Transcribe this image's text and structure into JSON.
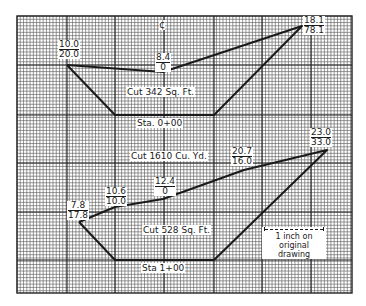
{
  "figure": {
    "type": "earthwork cross-sections on grid paper",
    "grid": {
      "left": 17,
      "top": 16,
      "right": 352,
      "bottom": 293,
      "minor_spacing": 3.27,
      "major_every": 15,
      "major_x": [
        67,
        115,
        164,
        214,
        262,
        311
      ],
      "major_y": [
        65,
        115,
        163,
        212,
        260
      ]
    },
    "centerline": {
      "symbol": "℄",
      "label": "¢",
      "x": 163,
      "y": 26
    }
  },
  "sections": [
    {
      "station": "Sta. 0+00",
      "area_label": "Cut 342 Sq. Ft.",
      "outline": [
        [
          67,
          65
        ],
        [
          163,
          72
        ],
        [
          302,
          26
        ],
        [
          214,
          115
        ],
        [
          115,
          115
        ],
        [
          67,
          65
        ]
      ],
      "elevations": [
        {
          "top": "10.0",
          "bottom": "20.0",
          "x": 58,
          "y": 40
        },
        {
          "top": "8.4",
          "bottom": "0",
          "x": 156,
          "y": 55
        },
        {
          "top": "18.1",
          "bottom": "78.1",
          "x": 304,
          "y": 17
        }
      ],
      "area_pos": {
        "x": 125,
        "y": 86
      },
      "station_pos": {
        "x": 135,
        "y": 118
      }
    },
    {
      "station": "Sta 1+00",
      "area_label": "Cut 528 Sq. Ft.",
      "outline": [
        [
          79,
          222
        ],
        [
          115,
          207
        ],
        [
          163,
          199
        ],
        [
          244,
          170
        ],
        [
          327,
          150
        ],
        [
          214,
          260
        ],
        [
          115,
          260
        ],
        [
          79,
          222
        ]
      ],
      "elevations": [
        {
          "top": "7.8",
          "bottom": "17.8",
          "x": 67,
          "y": 201
        },
        {
          "top": "10.6",
          "bottom": "10.0",
          "x": 106,
          "y": 187
        },
        {
          "top": "12.4",
          "bottom": "0",
          "x": 155,
          "y": 178
        },
        {
          "top": "20.7",
          "bottom": "16.0",
          "x": 231,
          "y": 148
        },
        {
          "top": "23.0",
          "bottom": "33.0",
          "x": 311,
          "y": 129
        }
      ],
      "area_pos": {
        "x": 143,
        "y": 224
      },
      "station_pos": {
        "x": 141,
        "y": 263
      }
    }
  ],
  "volume": {
    "label": "Cut 1610 Cu. Yd.",
    "x": 130,
    "y": 150
  },
  "scale_note": {
    "line1": "1 inch on",
    "line2": "original drawing",
    "x": 261,
    "y": 226
  },
  "colors": {
    "ink": "#1a1a1a",
    "grid_minor": "#555555",
    "grid_major": "#222222",
    "paper": "#ffffff"
  }
}
